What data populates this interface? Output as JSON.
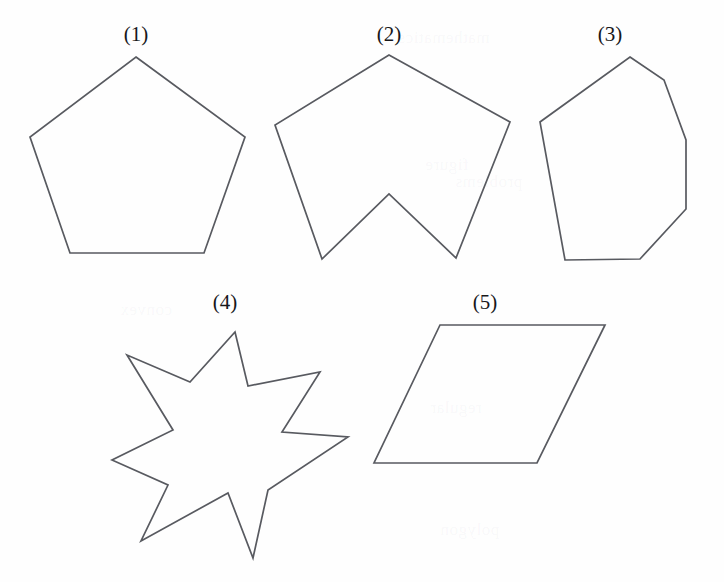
{
  "page": {
    "width": 724,
    "height": 582,
    "background_color": "#fefefe",
    "stroke_color": "#585a60",
    "label_color": "#17171a",
    "cropped_header_text": "angles p 4/8"
  },
  "figures": [
    {
      "id": "figure-1",
      "label": "(1)",
      "label_x": 136,
      "label_y": 24,
      "shape_name": "regular-pentagon",
      "vertex_count": 5,
      "convex": true,
      "points": "136,57 245,137 204,253 70,253 30,137"
    },
    {
      "id": "figure-2",
      "label": "(2)",
      "label_x": 389,
      "label_y": 24,
      "shape_name": "concave-hexagon-chevron",
      "vertex_count": 6,
      "convex": false,
      "points": "389,55 510,122 456,258 389,194 322,259 275,125"
    },
    {
      "id": "figure-3",
      "label": "(3)",
      "label_x": 610,
      "label_y": 24,
      "shape_name": "convex-heptagon",
      "vertex_count": 7,
      "convex": true,
      "points": "630,57 664,80 686,140 686,209 640,259 565,260 540,122"
    },
    {
      "id": "figure-4",
      "label": "(4)",
      "label_x": 225,
      "label_y": 292,
      "shape_name": "seven-pointed-star",
      "vertex_count": 14,
      "convex": false,
      "points": "235,332 248,386 320,372 282,432 348,437 268,490 253,558 228,493 141,541 168,485 112,460 173,430 127,355 190,382"
    },
    {
      "id": "figure-5",
      "label": "(5)",
      "label_x": 485,
      "label_y": 292,
      "shape_name": "parallelogram",
      "vertex_count": 4,
      "convex": true,
      "points": "440,325 605,325 537,463 374,463"
    }
  ],
  "ghost_text": [
    {
      "text": "mathematics",
      "x": 398,
      "y": 28
    },
    {
      "text": "figure",
      "x": 425,
      "y": 155
    },
    {
      "text": "problems",
      "x": 455,
      "y": 172
    },
    {
      "text": "regular",
      "x": 430,
      "y": 398
    },
    {
      "text": "polygon",
      "x": 440,
      "y": 520
    },
    {
      "text": "convex",
      "x": 120,
      "y": 300
    }
  ]
}
